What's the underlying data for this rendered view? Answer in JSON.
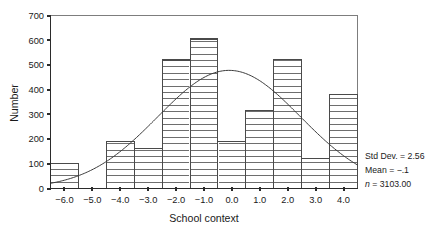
{
  "chart_data": {
    "type": "bar",
    "title": "",
    "subtitle": "",
    "xlabel": "School context",
    "ylabel": "Number",
    "categories": [
      "-6.0",
      "-5.0",
      "-4.0",
      "-3.0",
      "-2.0",
      "-1.0",
      "0.0",
      "1.0",
      "2.0",
      "3.0",
      "4.0"
    ],
    "x": [
      -6.0,
      -5.0,
      -4.0,
      -3.0,
      -2.0,
      -1.0,
      0.0,
      1.0,
      2.0,
      3.0,
      4.0
    ],
    "values": [
      100,
      0,
      190,
      162,
      520,
      605,
      190,
      315,
      522,
      120,
      380
    ],
    "bin_width": 1.0,
    "xlim": [
      -6.5,
      4.5
    ],
    "ylim": [
      0,
      700
    ],
    "ytick_labels": [
      "0",
      "100",
      "200",
      "300",
      "400",
      "500",
      "600",
      "700"
    ],
    "yticks": [
      0,
      100,
      200,
      300,
      400,
      500,
      600,
      700
    ],
    "xtick_labels": [
      "-6.0",
      "-5.0",
      "-4.0",
      "-3.0",
      "-2.0",
      "-1.0",
      "0.0",
      "1.0",
      "2.0",
      "3.0",
      "4.0"
    ],
    "grid": false,
    "legend_position": "right",
    "bar_style": "horizontal-hatch",
    "overlay": {
      "type": "line",
      "name": "normal-curve",
      "peak_value": 478,
      "peak_x": -0.1
    },
    "annotations": {
      "std_dev_label": "Std Dev. = 2.56",
      "mean_label": "Mean = −.1",
      "n_italic": "n",
      "n_label": " = 3103.00"
    }
  },
  "colors": {
    "background": "#ffffff",
    "axis": "#2b2b2b",
    "bar_stroke": "#4a4a4a",
    "curve": "#3a3a3a",
    "text": "#1a1a1a"
  }
}
